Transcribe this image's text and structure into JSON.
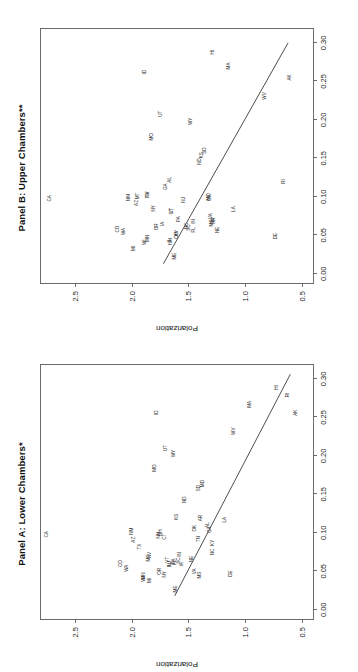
{
  "figure": {
    "ylabel": "Polarization",
    "xticks": [
      "0.00",
      "0.05",
      "0.10",
      "0.15",
      "0.20",
      "0.25",
      "0.30"
    ],
    "xtick_values": [
      0.0,
      0.05,
      0.1,
      0.15,
      0.2,
      0.25,
      0.3
    ],
    "yticks": [
      "0.5",
      "1.0",
      "1.5",
      "2.0",
      "2.5"
    ],
    "ytick_values": [
      0.5,
      1.0,
      1.5,
      2.0,
      2.5
    ]
  },
  "chart_data": [
    {
      "type": "scatter",
      "panel_id": "panel-lower",
      "title": "Panel A: Lower Chambers*",
      "xlabel": "",
      "ylabel": "Polarization",
      "xlim": [
        -0.012,
        0.318
      ],
      "ylim": [
        0.4,
        2.8
      ],
      "grid": false,
      "legend": "none",
      "point_style": "text-label",
      "fit_line": {
        "x0": 0.018,
        "y0": 1.62,
        "x1": 0.306,
        "y1": 0.6
      },
      "points": [
        {
          "label": "CA",
          "x": 0.098,
          "y": 2.75
        },
        {
          "label": "CO",
          "x": 0.06,
          "y": 2.09
        },
        {
          "label": "WA",
          "x": 0.054,
          "y": 2.04
        },
        {
          "label": "NM",
          "x": 0.102,
          "y": 2.0
        },
        {
          "label": "AZ",
          "x": 0.091,
          "y": 1.98
        },
        {
          "label": "TX",
          "x": 0.082,
          "y": 1.93
        },
        {
          "label": "MN",
          "x": 0.044,
          "y": 1.89
        },
        {
          "label": "WI",
          "x": 0.04,
          "y": 1.89
        },
        {
          "label": "MI",
          "x": 0.038,
          "y": 1.84
        },
        {
          "label": "MT",
          "x": 0.067,
          "y": 1.85
        },
        {
          "label": "NV",
          "x": 0.071,
          "y": 1.84
        },
        {
          "label": "OR",
          "x": 0.05,
          "y": 1.75
        },
        {
          "label": "ME",
          "x": 0.027,
          "y": 1.61
        },
        {
          "label": "NY",
          "x": 0.046,
          "y": 1.71
        },
        {
          "label": "IL",
          "x": 0.058,
          "y": 1.66
        },
        {
          "label": "NJ",
          "x": 0.06,
          "y": 1.66
        },
        {
          "label": "NH",
          "x": 0.097,
          "y": 1.76
        },
        {
          "label": "OH",
          "x": 0.1,
          "y": 1.74
        },
        {
          "label": "CT",
          "x": 0.095,
          "y": 1.71
        },
        {
          "label": "PA",
          "x": 0.063,
          "y": 1.63
        },
        {
          "label": "FL",
          "x": 0.062,
          "y": 1.62
        },
        {
          "label": "VT",
          "x": 0.065,
          "y": 1.68
        },
        {
          "label": "SC",
          "x": 0.064,
          "y": 1.58
        },
        {
          "label": "IA",
          "x": 0.059,
          "y": 1.56
        },
        {
          "label": "IN",
          "x": 0.072,
          "y": 1.57
        },
        {
          "label": "MO",
          "x": 0.184,
          "y": 1.79
        },
        {
          "label": "UT",
          "x": 0.21,
          "y": 1.7
        },
        {
          "label": "ID",
          "x": 0.256,
          "y": 1.78
        },
        {
          "label": "WY",
          "x": 0.203,
          "y": 1.63
        },
        {
          "label": "KS",
          "x": 0.121,
          "y": 1.6
        },
        {
          "label": "ND",
          "x": 0.143,
          "y": 1.53
        },
        {
          "label": "NE",
          "x": 0.066,
          "y": 1.47
        },
        {
          "label": "VA",
          "x": 0.05,
          "y": 1.44
        },
        {
          "label": "MS",
          "x": 0.045,
          "y": 1.4
        },
        {
          "label": "OK",
          "x": 0.106,
          "y": 1.44
        },
        {
          "label": "TN",
          "x": 0.092,
          "y": 1.41
        },
        {
          "label": "AR",
          "x": 0.119,
          "y": 1.39
        },
        {
          "label": "SD",
          "x": 0.158,
          "y": 1.41
        },
        {
          "label": "MD",
          "x": 0.164,
          "y": 1.37
        },
        {
          "label": "AL",
          "x": 0.11,
          "y": 1.33
        },
        {
          "label": "GA",
          "x": 0.104,
          "y": 1.31
        },
        {
          "label": "KY",
          "x": 0.087,
          "y": 1.28
        },
        {
          "label": "NC",
          "x": 0.075,
          "y": 1.28
        },
        {
          "label": "LA",
          "x": 0.117,
          "y": 1.18
        },
        {
          "label": "DE",
          "x": 0.047,
          "y": 1.12
        },
        {
          "label": "WV",
          "x": 0.232,
          "y": 1.1
        },
        {
          "label": "MA",
          "x": 0.267,
          "y": 0.96
        },
        {
          "label": "RI",
          "x": 0.279,
          "y": 0.62
        },
        {
          "label": "HI",
          "x": 0.289,
          "y": 0.72
        },
        {
          "label": "AK",
          "x": 0.256,
          "y": 0.55
        }
      ]
    },
    {
      "type": "scatter",
      "panel_id": "panel-upper",
      "title": "Panel B: Upper Chambers**",
      "xlabel": "",
      "ylabel": "Polarization",
      "xlim": [
        -0.012,
        0.318
      ],
      "ylim": [
        0.4,
        2.8
      ],
      "grid": false,
      "legend": "none",
      "point_style": "text-label",
      "fit_line": {
        "x0": 0.013,
        "y0": 1.72,
        "x1": 0.3,
        "y1": 0.62
      },
      "points": [
        {
          "label": "CA",
          "x": 0.098,
          "y": 2.72
        },
        {
          "label": "CO",
          "x": 0.058,
          "y": 2.12
        },
        {
          "label": "WA",
          "x": 0.055,
          "y": 2.07
        },
        {
          "label": "MI",
          "x": 0.033,
          "y": 1.98
        },
        {
          "label": "NM",
          "x": 0.099,
          "y": 2.02
        },
        {
          "label": "AZ",
          "x": 0.092,
          "y": 1.95
        },
        {
          "label": "MT",
          "x": 0.101,
          "y": 1.94
        },
        {
          "label": "WI",
          "x": 0.041,
          "y": 1.88
        },
        {
          "label": "MN",
          "x": 0.046,
          "y": 1.86
        },
        {
          "label": "NV",
          "x": 0.103,
          "y": 1.86
        },
        {
          "label": "TX",
          "x": 0.103,
          "y": 1.86
        },
        {
          "label": "NY",
          "x": 0.085,
          "y": 1.8
        },
        {
          "label": "OR",
          "x": 0.061,
          "y": 1.78
        },
        {
          "label": "IA",
          "x": 0.065,
          "y": 1.72
        },
        {
          "label": "ME",
          "x": 0.023,
          "y": 1.62
        },
        {
          "label": "IL",
          "x": 0.043,
          "y": 1.66
        },
        {
          "label": "NH",
          "x": 0.042,
          "y": 1.65
        },
        {
          "label": "OH",
          "x": 0.05,
          "y": 1.6
        },
        {
          "label": "KY",
          "x": 0.053,
          "y": 1.6
        },
        {
          "label": "GA",
          "x": 0.113,
          "y": 1.7
        },
        {
          "label": "AL",
          "x": 0.122,
          "y": 1.66
        },
        {
          "label": "VT",
          "x": 0.082,
          "y": 1.64
        },
        {
          "label": "CT",
          "x": 0.081,
          "y": 1.64
        },
        {
          "label": "PA",
          "x": 0.071,
          "y": 1.58
        },
        {
          "label": "NJ",
          "x": 0.096,
          "y": 1.54
        },
        {
          "label": "NC",
          "x": 0.062,
          "y": 1.51
        },
        {
          "label": "SC",
          "x": 0.06,
          "y": 1.49
        },
        {
          "label": "FL",
          "x": 0.057,
          "y": 1.45
        },
        {
          "label": "IN",
          "x": 0.068,
          "y": 1.45
        },
        {
          "label": "MO",
          "x": 0.178,
          "y": 1.82
        },
        {
          "label": "UT",
          "x": 0.208,
          "y": 1.74
        },
        {
          "label": "ID",
          "x": 0.262,
          "y": 1.88
        },
        {
          "label": "WY",
          "x": 0.198,
          "y": 1.48
        },
        {
          "label": "KS",
          "x": 0.154,
          "y": 1.38
        },
        {
          "label": "ND",
          "x": 0.146,
          "y": 1.4
        },
        {
          "label": "SD",
          "x": 0.16,
          "y": 1.35
        },
        {
          "label": "MD",
          "x": 0.1,
          "y": 1.32
        },
        {
          "label": "OK",
          "x": 0.099,
          "y": 1.31
        },
        {
          "label": "VA",
          "x": 0.075,
          "y": 1.3
        },
        {
          "label": "MS",
          "x": 0.066,
          "y": 1.29
        },
        {
          "label": "TN",
          "x": 0.068,
          "y": 1.28
        },
        {
          "label": "AR",
          "x": 0.069,
          "y": 1.27
        },
        {
          "label": "NE",
          "x": 0.057,
          "y": 1.24
        },
        {
          "label": "LA",
          "x": 0.084,
          "y": 1.1
        },
        {
          "label": "DE",
          "x": 0.049,
          "y": 0.73
        },
        {
          "label": "RI",
          "x": 0.12,
          "y": 0.66
        },
        {
          "label": "WV",
          "x": 0.231,
          "y": 0.82
        },
        {
          "label": "MA",
          "x": 0.27,
          "y": 1.14
        },
        {
          "label": "HI",
          "x": 0.288,
          "y": 1.28
        },
        {
          "label": "AK",
          "x": 0.255,
          "y": 0.6
        }
      ]
    }
  ]
}
